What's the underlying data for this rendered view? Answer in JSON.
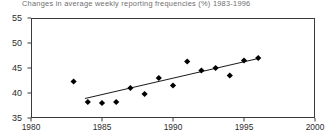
{
  "chart_data": {
    "type": "scatter",
    "title": "Changes in average weekly reporting frequencies (%) 1983-1996",
    "xlabel": "",
    "ylabel": "",
    "xlim": [
      1980,
      2000
    ],
    "ylim": [
      35,
      55
    ],
    "xticks": [
      1980,
      1985,
      1990,
      1995,
      2000
    ],
    "xtick_labels": [
      "1980",
      "1985",
      "1990",
      "1995",
      "2000"
    ],
    "yticks": [
      35,
      40,
      45,
      50,
      55
    ],
    "ytick_labels": [
      "35",
      "40",
      "45",
      "50",
      "55"
    ],
    "grid": false,
    "legend": null,
    "marker": "filled-diamond",
    "marker_color": "#000000",
    "x": [
      1983,
      1984,
      1985,
      1986,
      1987,
      1988,
      1989,
      1990,
      1991,
      1992,
      1993,
      1994,
      1995,
      1996
    ],
    "values": [
      42.3,
      38.2,
      38.0,
      38.2,
      41.0,
      39.8,
      43.0,
      41.5,
      46.3,
      44.5,
      45.0,
      43.5,
      46.5,
      47.0
    ],
    "points": [
      {
        "x": 1983,
        "y": 42.3
      },
      {
        "x": 1984,
        "y": 38.2
      },
      {
        "x": 1985,
        "y": 38.0
      },
      {
        "x": 1986,
        "y": 38.2
      },
      {
        "x": 1987,
        "y": 41.0
      },
      {
        "x": 1988,
        "y": 39.8
      },
      {
        "x": 1989,
        "y": 43.0
      },
      {
        "x": 1990,
        "y": 41.5
      },
      {
        "x": 1991,
        "y": 46.3
      },
      {
        "x": 1992,
        "y": 44.5
      },
      {
        "x": 1993,
        "y": 45.0
      },
      {
        "x": 1994,
        "y": 43.5
      },
      {
        "x": 1995,
        "y": 46.5
      },
      {
        "x": 1996,
        "y": 47.0
      }
    ],
    "trendline": {
      "type": "linear-fit",
      "x_start": 1983.8,
      "y_start": 38.9,
      "x_end": 1996.0,
      "y_end": 46.9,
      "color": "#1a1a1a"
    },
    "axis_color": "#3a3a3a",
    "background": "#ffffff"
  }
}
